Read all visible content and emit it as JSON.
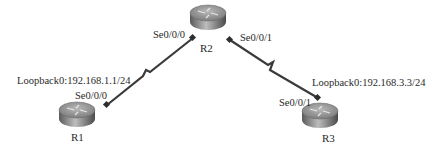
{
  "diagram": {
    "type": "network-topology",
    "routers": [
      {
        "id": "R1",
        "name": "R1",
        "icon": "router-icon"
      },
      {
        "id": "R2",
        "name": "R2",
        "icon": "router-icon"
      },
      {
        "id": "R3",
        "name": "R3",
        "icon": "router-icon"
      }
    ],
    "links": [
      {
        "from": "R1",
        "to": "R2",
        "type": "serial",
        "from_interface": "Se0/0/0",
        "to_interface": "Se0/0/0"
      },
      {
        "from": "R2",
        "to": "R3",
        "type": "serial",
        "from_interface": "Se0/0/1",
        "to_interface": "Se0/0/1"
      }
    ],
    "labels": {
      "r2_se000": "Se0/0/0",
      "r2_se001": "Se0/0/1",
      "r1_loopback": "Loopback0:192.168.1.1/24",
      "r1_se000": "Se0/0/0",
      "r3_loopback": "Loopback0:192.168.3.3/24",
      "r3_se001": "Se0/0/1"
    },
    "colors": {
      "link": "#3a3a3a",
      "router_top": "#9a9a9a",
      "router_side": "#6e6e6e",
      "background": "#ffffff"
    }
  }
}
